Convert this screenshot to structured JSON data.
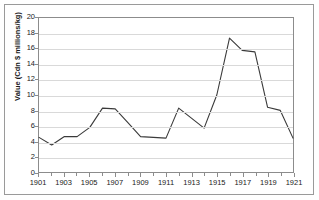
{
  "chart_data": {
    "type": "line",
    "title": "",
    "xlabel": "",
    "ylabel": "Value (Cdn $ millions/kg)",
    "x": [
      1901,
      1902,
      1903,
      1904,
      1905,
      1906,
      1907,
      1908,
      1909,
      1910,
      1911,
      1912,
      1913,
      1914,
      1915,
      1916,
      1917,
      1918,
      1919,
      1920,
      1921
    ],
    "values": [
      4.5,
      3.5,
      4.6,
      4.6,
      5.8,
      8.3,
      8.2,
      6.4,
      4.6,
      4.5,
      4.4,
      8.3,
      7.0,
      5.7,
      10.0,
      17.4,
      15.8,
      15.6,
      8.4,
      8.0,
      4.4
    ],
    "series": [
      {
        "name": "Value",
        "color": "#3a3a3a",
        "values": [
          4.5,
          3.5,
          4.6,
          4.6,
          5.8,
          8.3,
          8.2,
          6.4,
          4.6,
          4.5,
          4.4,
          8.3,
          7.0,
          5.7,
          10.0,
          17.4,
          15.8,
          15.6,
          8.4,
          8.0,
          4.4
        ]
      }
    ],
    "xlim": [
      1901,
      1921
    ],
    "ylim": [
      0,
      20
    ],
    "ytick_step": 2,
    "yticks": [
      0,
      2,
      4,
      6,
      8,
      10,
      12,
      14,
      16,
      18,
      20
    ],
    "ytick_labels": [
      "0",
      "2",
      "4",
      "6",
      "8",
      "10",
      "12",
      "14",
      "16",
      "18",
      "20"
    ],
    "xticks": [
      1901,
      1902,
      1903,
      1904,
      1905,
      1906,
      1907,
      1908,
      1909,
      1910,
      1911,
      1912,
      1913,
      1914,
      1915,
      1916,
      1917,
      1918,
      1919,
      1920,
      1921
    ],
    "xtick_labels": [
      "1901",
      "1903",
      "1905",
      "1907",
      "1909",
      "1911",
      "1913",
      "1915",
      "1917",
      "1919",
      "1921"
    ],
    "xtick_label_values": [
      1901,
      1903,
      1905,
      1907,
      1909,
      1911,
      1913,
      1915,
      1917,
      1919,
      1921
    ],
    "grid": "horizontal",
    "grid_color": "#d9d9d9",
    "legend": "none",
    "plot_border_color": "#8c8c8c",
    "background": "#ffffff",
    "line_color": "#3a3a3a"
  }
}
